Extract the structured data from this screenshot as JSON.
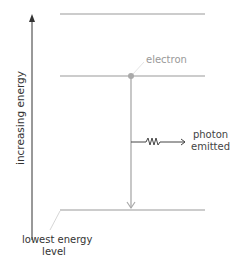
{
  "diagram": {
    "axis": {
      "label": "increasing energy"
    },
    "energy_levels": [
      {
        "name": "level-3",
        "y": 14
      },
      {
        "name": "level-2",
        "y": 76
      },
      {
        "name": "lowest",
        "y": 210
      }
    ],
    "electron": {
      "label": "electron"
    },
    "photon": {
      "line1": "photon",
      "line2": "emitted"
    },
    "lowest_level": {
      "line1": "lowest energy",
      "line2": "level"
    },
    "colors": {
      "level_line": "#bbbbbb",
      "transition": "#aaaaaa",
      "axis": "#333333",
      "photon": "#444444",
      "electron_dot": "#aaaaaa"
    }
  }
}
